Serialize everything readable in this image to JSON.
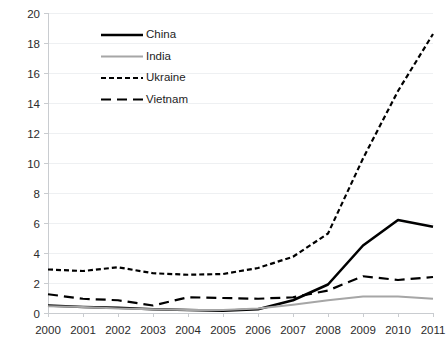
{
  "chart_data": {
    "type": "line",
    "title": "",
    "xlabel": "",
    "ylabel": "",
    "categories": [
      "2000",
      "2001",
      "2002",
      "2003",
      "2004",
      "2005",
      "2006",
      "2007",
      "2008",
      "2009",
      "2010",
      "2011"
    ],
    "x": [
      2000,
      2001,
      2002,
      2003,
      2004,
      2005,
      2006,
      2007,
      2008,
      2009,
      2010,
      2011
    ],
    "xlim": [
      2000,
      2011
    ],
    "ylim": [
      0,
      20
    ],
    "ytick_labels": [
      "0",
      "2",
      "4",
      "6",
      "8",
      "10",
      "12",
      "14",
      "16",
      "18",
      "20"
    ],
    "ytick_values": [
      0,
      2,
      4,
      6,
      8,
      10,
      12,
      14,
      16,
      18,
      20
    ],
    "grid": "horizontal",
    "legend_position": "upper-left",
    "series": [
      {
        "name": "China",
        "color": "#000000",
        "style": "solid",
        "width": 2.6,
        "values": [
          0.5,
          0.4,
          0.35,
          0.25,
          0.2,
          0.15,
          0.25,
          0.85,
          1.9,
          4.5,
          6.2,
          5.75
        ]
      },
      {
        "name": "India",
        "color": "#A6A6A6",
        "style": "solid",
        "width": 2.2,
        "values": [
          0.45,
          0.4,
          0.3,
          0.25,
          0.2,
          0.2,
          0.3,
          0.55,
          0.85,
          1.1,
          1.1,
          0.95
        ]
      },
      {
        "name": "Ukraine",
        "color": "#000000",
        "style": "dotted-dash",
        "width": 2.2,
        "values": [
          2.9,
          2.8,
          3.05,
          2.65,
          2.55,
          2.6,
          3.0,
          3.75,
          5.3,
          10.3,
          14.8,
          18.6
        ]
      },
      {
        "name": "Vietnam",
        "color": "#000000",
        "style": "long-dash",
        "width": 2.2,
        "values": [
          1.25,
          0.95,
          0.85,
          0.5,
          1.05,
          1.0,
          0.95,
          1.05,
          1.5,
          2.45,
          2.2,
          2.4
        ]
      }
    ]
  },
  "legend": {
    "entries": [
      {
        "label": "China"
      },
      {
        "label": "India"
      },
      {
        "label": "Ukraine"
      },
      {
        "label": "Vietnam"
      }
    ]
  },
  "colors": {
    "background": "#ffffff",
    "grid": "#eef0f2",
    "axis": "#c9ccd0",
    "text": "#2b2b2b",
    "china": "#000000",
    "india": "#A6A6A6",
    "ukraine": "#000000",
    "vietnam": "#000000"
  }
}
